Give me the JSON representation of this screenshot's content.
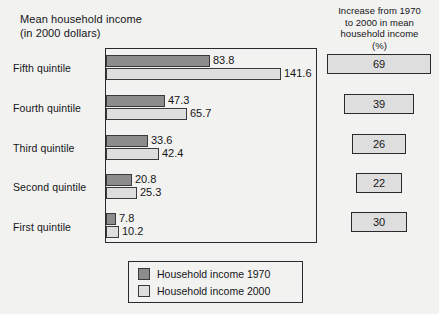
{
  "left_panel": {
    "title": "Mean household income\n(in 2000 dollars)"
  },
  "right_panel": {
    "title": "Increase from 1970\nto 2000 in mean\nhousehold income\n(%)"
  },
  "legend": {
    "items": [
      {
        "label": "Household income 1970",
        "color": "#8c8c8c"
      },
      {
        "label": "Household income 2000",
        "color": "#dedede"
      }
    ]
  },
  "chart_data": {
    "type": "bar",
    "orientation": "horizontal",
    "title": "Mean household income (in 2000 dollars)",
    "xlabel": "",
    "ylabel": "",
    "grid": false,
    "legend_position": "bottom",
    "categories": [
      "Fifth quintile",
      "Fourth quintile",
      "Third quintile",
      "Second quintile",
      "First quintile"
    ],
    "series": [
      {
        "name": "Household income 1970",
        "color": "#8c8c8c",
        "values": [
          83.8,
          47.3,
          33.6,
          20.8,
          7.8
        ]
      },
      {
        "name": "Household income 2000",
        "color": "#dedede",
        "values": [
          141.6,
          65.7,
          42.4,
          25.3,
          10.2
        ]
      }
    ],
    "xlim": [
      0,
      150
    ],
    "value_labels": {
      "1970": [
        "83.8",
        "47.3",
        "33.6",
        "20.8",
        "7.8"
      ],
      "2000": [
        "141.6",
        "65.7",
        "42.4",
        "25.3",
        "10.2"
      ]
    },
    "secondary_panel": {
      "title": "Increase from 1970 to 2000 in mean household income (%)",
      "categories": [
        "Fifth quintile",
        "Fourth quintile",
        "Third quintile",
        "Second quintile",
        "First quintile"
      ],
      "values": [
        69,
        39,
        26,
        22,
        30
      ],
      "labels": [
        "69",
        "39",
        "26",
        "22",
        "30"
      ]
    }
  },
  "rows": [
    {
      "category": "Fifth quintile",
      "label_top": 62,
      "bar1970_top": 55,
      "bar1970_width": 104,
      "bar1970_value": "83.8",
      "bar2000_top": 68,
      "bar2000_width": 175,
      "bar2000_value": "141.6",
      "pct": "69",
      "pct_left": 327,
      "pct_width": 104,
      "pct_top": 54
    },
    {
      "category": "Fourth quintile",
      "label_top": 102,
      "bar1970_top": 95,
      "bar1970_width": 59,
      "bar1970_value": "47.3",
      "bar2000_top": 108,
      "bar2000_width": 81,
      "bar2000_value": "65.7",
      "pct": "39",
      "pct_left": 344,
      "pct_width": 70,
      "pct_top": 94
    },
    {
      "category": "Third quintile",
      "label_top": 142,
      "bar1970_top": 135,
      "bar1970_width": 42,
      "bar1970_value": "33.6",
      "bar2000_top": 148,
      "bar2000_width": 53,
      "bar2000_value": "42.4",
      "pct": "26",
      "pct_left": 352,
      "pct_width": 54,
      "pct_top": 134
    },
    {
      "category": "Second quintile",
      "label_top": 181,
      "bar1970_top": 174,
      "bar1970_width": 26,
      "bar1970_value": "20.8",
      "bar2000_top": 187,
      "bar2000_width": 31,
      "bar2000_value": "25.3",
      "pct": "22",
      "pct_left": 356,
      "pct_width": 46,
      "pct_top": 173
    },
    {
      "category": "First quintile",
      "label_top": 221,
      "bar1970_top": 213,
      "bar1970_width": 10,
      "bar1970_value": "7.8",
      "bar2000_top": 226,
      "bar2000_width": 13,
      "bar2000_value": "10.2",
      "pct": "30",
      "pct_left": 351,
      "pct_width": 56,
      "pct_top": 212
    }
  ]
}
